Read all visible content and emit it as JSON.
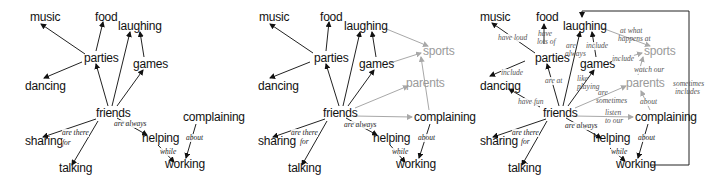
{
  "panels": [
    {
      "id": "panel-1",
      "nodes": {
        "music": "music",
        "food": "food",
        "laughing": "laughing",
        "parties": "parties",
        "games": "games",
        "dancing": "dancing",
        "friends": "friends",
        "complaining": "complaining",
        "sharing": "sharing",
        "helping": "helping",
        "talking": "talking",
        "working": "working"
      },
      "labels": {
        "are_there_for_1": "are there",
        "are_there_for_2": "for",
        "are_always": "are always",
        "while": "while",
        "about": "about"
      }
    },
    {
      "id": "panel-2",
      "nodes": {
        "music": "music",
        "food": "food",
        "laughing": "laughing",
        "parties": "parties",
        "games": "games",
        "sports": "sports",
        "parents": "parents",
        "dancing": "dancing",
        "friends": "friends",
        "complaining": "complaining",
        "sharing": "sharing",
        "helping": "helping",
        "talking": "talking",
        "working": "working"
      },
      "labels": {
        "are_there_for_1": "are there",
        "are_there_for_2": "for",
        "are_always": "are always",
        "while": "while",
        "about": "about"
      }
    },
    {
      "id": "panel-3",
      "nodes": {
        "music": "music",
        "food": "food",
        "laughing": "laughing",
        "parties": "parties",
        "games": "games",
        "sports": "sports",
        "parents": "parents",
        "dancing": "dancing",
        "friends": "friends",
        "complaining": "complaining",
        "sharing": "sharing",
        "helping": "helping",
        "talking": "talking",
        "working": "working"
      },
      "labels": {
        "have_loud": "have loud",
        "have_lots_of_1": "have",
        "have_lots_of_2": "lots of",
        "are_always_top_1": "are",
        "are_always_top_2": "always",
        "include_games": "include",
        "at_what_1": "at what",
        "at_what_2": "happens at",
        "include_sports": "include",
        "include_dancing": "include",
        "are_at": "are at",
        "like_playing_1": "like",
        "like_playing_2": "playing",
        "watch_our": "watch our",
        "sometimes_includes_1": "sometimes",
        "sometimes_includes_2": "includes",
        "have_fun": "have fun",
        "are_sometimes_1": "are",
        "are_sometimes_2": "sometimes",
        "about_parents": "about",
        "listen_1": "listen",
        "listen_2": "to our",
        "are_always": "are always",
        "are_there_for_1": "are there",
        "are_there_for_2": "for",
        "about": "about",
        "while": "while"
      }
    }
  ],
  "colors": {
    "primary": "#111111",
    "secondary": "#9a9a9a",
    "edge_gray": "#a8a8a8",
    "label": "#555555"
  }
}
